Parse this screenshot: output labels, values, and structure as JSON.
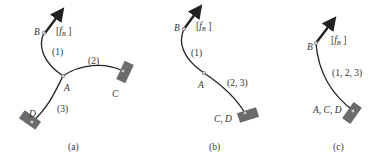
{
  "colors": {
    "curve": "#222222",
    "support": "#6b6b6b",
    "node_fill": "#cccccc",
    "node_stroke": "#666666",
    "text": "#333333"
  },
  "panels": [
    {
      "caption": "(a)",
      "force_label": "[fB]",
      "force_symbol": "f",
      "force_subscript": "B",
      "nodes": {
        "B": "B",
        "A": "A",
        "C": "C",
        "D": "D"
      },
      "members": [
        "(1)",
        "(2)",
        "(3)"
      ],
      "supports": [
        "C",
        "D"
      ]
    },
    {
      "caption": "(b)",
      "force_label": "[fB]",
      "force_symbol": "f",
      "force_subscript": "B",
      "nodes": {
        "B": "B",
        "A": "A",
        "CD": "C, D"
      },
      "members": [
        "(1)",
        "(2, 3)"
      ],
      "supports": [
        "C, D"
      ]
    },
    {
      "caption": "(c)",
      "force_label": "[fB]",
      "force_symbol": "f",
      "force_subscript": "B",
      "nodes": {
        "B": "B",
        "ACD": "A, C, D"
      },
      "members": [
        "(1, 2, 3)"
      ],
      "supports": [
        "A, C, D"
      ]
    }
  ]
}
